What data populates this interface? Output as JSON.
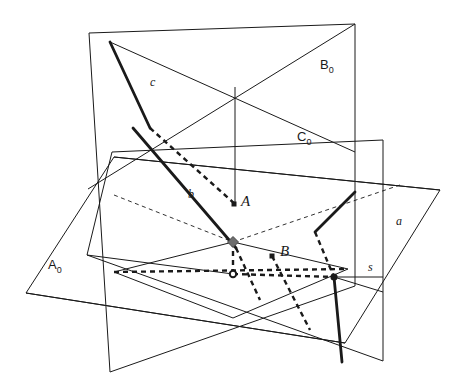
{
  "figure": {
    "type": "3d-geometry-diagram",
    "background_color": "#ffffff",
    "stroke_color": "#1a1a1a",
    "accent_point_color": "#6e6e6e"
  },
  "labels": {
    "planes": [
      {
        "id": "A0",
        "base": "A",
        "sub": "0",
        "x": 48,
        "y": 257
      },
      {
        "id": "B0",
        "base": "B",
        "sub": "0",
        "x": 320,
        "y": 57
      },
      {
        "id": "C0",
        "base": "C",
        "sub": "0",
        "x": 297,
        "y": 129
      }
    ],
    "lines": [
      {
        "id": "a",
        "text": "a",
        "x": 396,
        "y": 214
      },
      {
        "id": "b",
        "text": "b",
        "x": 188,
        "y": 187
      },
      {
        "id": "c",
        "text": "c",
        "x": 150,
        "y": 75
      },
      {
        "id": "s",
        "text": "s",
        "x": 368,
        "y": 260
      }
    ],
    "points": [
      {
        "id": "A",
        "text": "A",
        "x": 241,
        "y": 193
      },
      {
        "id": "B",
        "text": "B",
        "x": 280,
        "y": 243
      }
    ]
  },
  "geometry": {
    "plane_A0": {
      "name": "A0",
      "points": "26,293 114,157 440,190 345,343"
    },
    "plane_B0": {
      "name": "B0",
      "points": "89,33 355,24 355,286 110,372"
    },
    "plane_C0": {
      "name": "C0",
      "points": "112,152 383,140 383,361 87,255"
    },
    "solid_thin_lines": [
      {
        "name": "b0-diag-1",
        "x1": 110,
        "y1": 42,
        "x2": 355,
        "y2": 152
      },
      {
        "name": "b0-diag-2",
        "x1": 355,
        "y1": 24,
        "x2": 88,
        "y2": 189
      },
      {
        "name": "b0-vertical-center",
        "x1": 235,
        "y1": 87,
        "x2": 235,
        "y2": 204
      },
      {
        "name": "c0-lower-left",
        "x1": 87,
        "y1": 255,
        "x2": 233,
        "y2": 274
      },
      {
        "name": "tri-left",
        "x1": 233,
        "y1": 242,
        "x2": 114,
        "y2": 272
      },
      {
        "name": "tri-right",
        "x1": 233,
        "y1": 242,
        "x2": 348,
        "y2": 269
      },
      {
        "name": "tri-bottom-left",
        "x1": 114,
        "y1": 272,
        "x2": 233,
        "y2": 318
      },
      {
        "name": "tri-bottom-right",
        "x1": 348,
        "y1": 269,
        "x2": 233,
        "y2": 318
      },
      {
        "name": "s-segment",
        "x1": 334,
        "y1": 277,
        "x2": 383,
        "y2": 277
      },
      {
        "name": "s-lower",
        "x1": 334,
        "y1": 277,
        "x2": 383,
        "y2": 292
      },
      {
        "name": "cross-long-1",
        "x1": 26,
        "y1": 293,
        "x2": 345,
        "y2": 343
      },
      {
        "name": "cross-long-2",
        "x1": 114,
        "y1": 157,
        "x2": 440,
        "y2": 190
      }
    ],
    "thick_lines": [
      {
        "name": "line-c-thick",
        "x1": 110,
        "y1": 42,
        "x2": 150,
        "y2": 128
      },
      {
        "name": "line-b-thick",
        "x1": 133,
        "y1": 128,
        "x2": 236,
        "y2": 248
      },
      {
        "name": "line-a-thick",
        "x1": 355,
        "y1": 192,
        "x2": 315,
        "y2": 232
      },
      {
        "name": "line-s-thick",
        "x1": 334,
        "y1": 277,
        "x2": 342,
        "y2": 362
      }
    ],
    "dashed_lines": [
      {
        "name": "dash-c-lower",
        "x1": 150,
        "y1": 128,
        "x2": 235,
        "y2": 204
      },
      {
        "name": "dash-thin-plane-left",
        "x1": 114,
        "y1": 195,
        "x2": 233,
        "y2": 242
      },
      {
        "name": "dash-thin-plane-right",
        "x1": 233,
        "y1": 242,
        "x2": 400,
        "y2": 185
      },
      {
        "name": "dash-horizontal",
        "x1": 114,
        "y1": 272,
        "x2": 348,
        "y2": 269
      },
      {
        "name": "dash-vertical",
        "x1": 233,
        "y1": 242,
        "x2": 233,
        "y2": 274
      },
      {
        "name": "dash-b-lower",
        "x1": 236,
        "y1": 248,
        "x2": 260,
        "y2": 300
      },
      {
        "name": "dash-B-lower",
        "x1": 272,
        "y1": 256,
        "x2": 310,
        "y2": 330
      },
      {
        "name": "dash-a-lower",
        "x1": 315,
        "y1": 232,
        "x2": 334,
        "y2": 277
      },
      {
        "name": "dash-s-diag",
        "x1": 233,
        "y1": 274,
        "x2": 334,
        "y2": 277
      }
    ],
    "marked_points": [
      {
        "name": "point-A",
        "x": 234,
        "y": 204,
        "style": "filled-square",
        "color": "#1a1a1a"
      },
      {
        "name": "point-B",
        "x": 272,
        "y": 256,
        "style": "filled-square",
        "color": "#1a1a1a"
      },
      {
        "name": "point-center-diamond",
        "x": 233,
        "y": 242,
        "style": "gray-diamond",
        "color": "#6e6e6e"
      },
      {
        "name": "point-foot-circle",
        "x": 233,
        "y": 274,
        "style": "open-circle",
        "color": "#1a1a1a"
      },
      {
        "name": "point-s-node",
        "x": 334,
        "y": 277,
        "style": "filled-circle",
        "color": "#1a1a1a"
      }
    ]
  }
}
